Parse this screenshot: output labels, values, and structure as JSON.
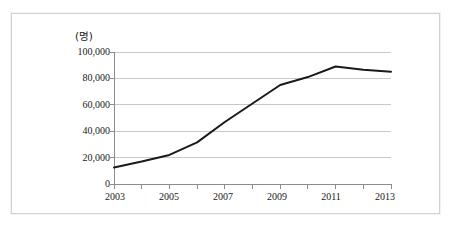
{
  "chart_data": {
    "type": "line",
    "title": "",
    "subtitle": "",
    "xlabel": "",
    "ylabel": "",
    "unit_label": "(명)",
    "x": [
      2003,
      2004,
      2005,
      2006,
      2007,
      2008,
      2009,
      2010,
      2011,
      2012,
      2013
    ],
    "categories": [
      "2003",
      "2004",
      "2005",
      "2006",
      "2007",
      "2008",
      "2009",
      "2010",
      "2011",
      "2012",
      "2013"
    ],
    "values": [
      12500,
      17000,
      22000,
      31500,
      47000,
      61000,
      75000,
      81000,
      89000,
      86500,
      85000
    ],
    "series": [
      {
        "name": "",
        "values": [
          12500,
          17000,
          22000,
          31500,
          47000,
          61000,
          75000,
          81000,
          89000,
          86500,
          85000
        ],
        "color": "#1a1a1a"
      }
    ],
    "xlim": [
      2003,
      2013
    ],
    "ylim": [
      0,
      100000
    ],
    "y_ticks": [
      0,
      20000,
      40000,
      60000,
      80000,
      100000
    ],
    "y_tick_labels": [
      "0",
      "20,000",
      "40,000",
      "60,000",
      "80,000",
      "100,000"
    ],
    "x_ticks": [
      2003,
      2004,
      2005,
      2006,
      2007,
      2008,
      2009,
      2010,
      2011,
      2012,
      2013
    ],
    "x_tick_labels": [
      "2003",
      "",
      "2005",
      "",
      "2007",
      "",
      "2009",
      "",
      "2011",
      "",
      "2013"
    ],
    "x_tick_labels_shown": [
      "2003",
      "2005",
      "2007",
      "2009",
      "2011",
      "2013"
    ],
    "grid": true,
    "grid_axis": "y",
    "grid_color": "#c8c8c8",
    "legend": false,
    "legend_position": "none",
    "line_color": "#1a1a1a",
    "line_width": 2,
    "markers": false,
    "axis_color": "#808080",
    "background": "#ffffff",
    "border_color": "#d2d2d2"
  },
  "axes": {
    "unit_label": "(명)",
    "y_labels": [
      "100,000",
      "80,000",
      "60,000",
      "40,000",
      "20,000",
      "0"
    ],
    "x_labels": [
      "2003",
      "2005",
      "2007",
      "2009",
      "2011",
      "2013"
    ]
  }
}
